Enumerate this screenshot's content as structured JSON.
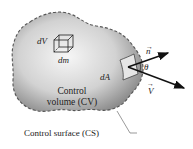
{
  "diagram": {
    "labels": {
      "volume_element": "dV",
      "mass_element": "dm",
      "area_element": "dA",
      "normal_vector": "n",
      "velocity_vector": "V",
      "angle": "θ",
      "control_volume_line1": "Control",
      "control_volume_line2": "volume (CV)",
      "control_surface": "Control surface (CS)"
    },
    "colors": {
      "fill_light": "#f4f4f4",
      "fill_dark": "#8a8a8a",
      "outline": "#555555",
      "text": "#222222",
      "arrow": "#111111"
    }
  }
}
